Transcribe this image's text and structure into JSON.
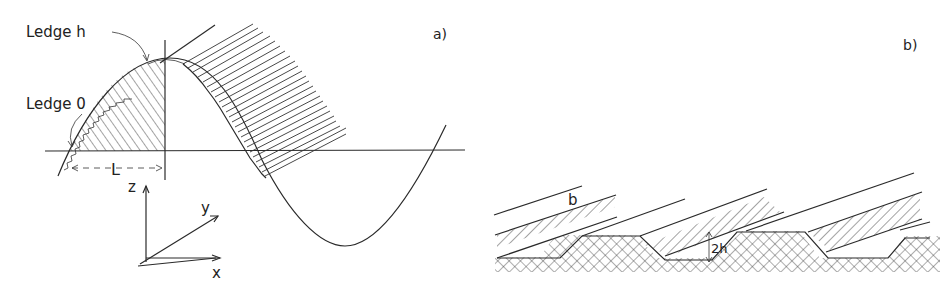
{
  "panel_a": {
    "label": "a)",
    "annotations": {
      "ledge_h": "Ledge h",
      "ledge_0": "Ledge 0",
      "length": "L"
    },
    "axes": {
      "z": "z",
      "y": "y",
      "x": "x"
    }
  },
  "panel_b": {
    "label": "b)",
    "annotations": {
      "width": "b",
      "height": "2h"
    }
  },
  "colors": {
    "ink": "#2a2a2a",
    "paper": "#ffffff"
  }
}
